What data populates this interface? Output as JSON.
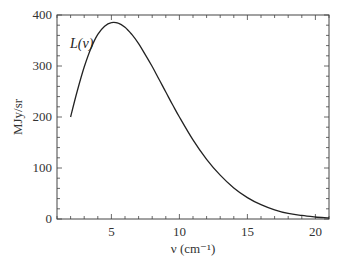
{
  "chart_data": {
    "type": "line",
    "title": "",
    "xlabel": "ν (cm⁻¹)",
    "ylabel": "MJy/sr",
    "xlim": [
      1,
      21
    ],
    "ylim": [
      0,
      400
    ],
    "grid": false,
    "legend": null,
    "annotations": [
      {
        "text": "L(ν)",
        "x": 2.2,
        "y": 355
      }
    ],
    "x_ticks": [
      5,
      10,
      15,
      20
    ],
    "y_ticks": [
      0,
      100,
      200,
      300,
      400
    ],
    "x_tick_labels": [
      "5",
      "10",
      "15",
      "20"
    ],
    "y_tick_labels": [
      "0",
      "100",
      "200",
      "300",
      "400"
    ],
    "series": [
      {
        "name": "L(ν)",
        "color": "#222222",
        "x": [
          2.0,
          2.5,
          3.0,
          3.5,
          4.0,
          4.5,
          5.0,
          5.5,
          6.0,
          6.5,
          7.0,
          7.5,
          8.0,
          8.5,
          9.0,
          9.5,
          10.0,
          11.0,
          12.0,
          13.0,
          14.0,
          15.0,
          16.0,
          17.0,
          18.0,
          19.0,
          20.0,
          21.0
        ],
        "values": [
          200,
          252,
          298,
          335,
          362,
          378,
          385,
          384,
          376,
          362,
          344,
          322,
          299,
          274,
          249,
          224,
          200,
          155,
          117,
          86,
          61,
          42,
          28,
          18,
          11,
          7,
          4,
          2
        ]
      }
    ]
  }
}
